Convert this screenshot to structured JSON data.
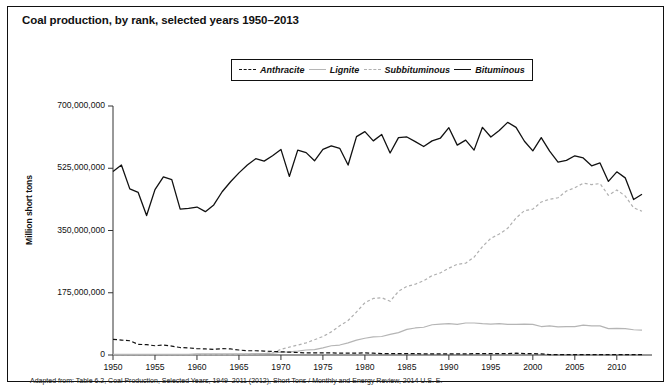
{
  "chart_title": "Coal production, by rank, selected years 1950–2013",
  "footnote": "Adapted from: Table 6.2, Coal Production, Selected Years, 1949–2011 (2012), Short Tons / Monthly and Energy Review, 2014 U.S. E.",
  "legend": {
    "position": "top-center",
    "items": [
      {
        "label": "Anthracite",
        "style": "dashed",
        "color": "#111111",
        "dash": "4,2.5"
      },
      {
        "label": "Lignite",
        "style": "solid",
        "color": "#b5b5b5",
        "dash": ""
      },
      {
        "label": "Subbituminous",
        "style": "dotted",
        "color": "#b0b0b0",
        "dash": "3,2.5"
      },
      {
        "label": "Bituminous",
        "style": "solid",
        "color": "#111111",
        "dash": ""
      }
    ]
  },
  "axes": {
    "ylabel": "Million short tons",
    "xlabel": "",
    "ylim": [
      0,
      700000000
    ],
    "xlim": [
      1950,
      2013
    ],
    "yticks": [
      0,
      175000000,
      350000000,
      525000000,
      700000000
    ],
    "ytick_labels": [
      "0",
      "175,000,000",
      "350,000,000",
      "525,000,000",
      "700,000,000"
    ],
    "xticks": [
      1950,
      1955,
      1960,
      1965,
      1970,
      1975,
      1980,
      1985,
      1990,
      1995,
      2000,
      2005,
      2010
    ],
    "xtick_labels": [
      "1950",
      "1955",
      "1960",
      "1965",
      "1970",
      "1975",
      "1980",
      "1985",
      "1990",
      "1995",
      "2000",
      "2005",
      "2010"
    ],
    "grid": false
  },
  "chart_data": {
    "type": "line",
    "title": "Coal production, by rank, selected years 1950–2013",
    "xlabel": "",
    "ylabel": "Million short tons",
    "ylim": [
      0,
      700000000
    ],
    "xlim": [
      1950,
      2013
    ],
    "grid": false,
    "legend_position": "top-center",
    "x": [
      1950,
      1951,
      1952,
      1953,
      1954,
      1955,
      1956,
      1957,
      1958,
      1959,
      1960,
      1961,
      1962,
      1963,
      1964,
      1965,
      1966,
      1967,
      1968,
      1969,
      1970,
      1971,
      1972,
      1973,
      1974,
      1975,
      1976,
      1977,
      1978,
      1979,
      1980,
      1981,
      1982,
      1983,
      1984,
      1985,
      1986,
      1987,
      1988,
      1989,
      1990,
      1991,
      1992,
      1993,
      1994,
      1995,
      1996,
      1997,
      1998,
      1999,
      2000,
      2001,
      2002,
      2003,
      2004,
      2005,
      2006,
      2007,
      2008,
      2009,
      2010,
      2011,
      2012,
      2013
    ],
    "series": [
      {
        "name": "Bituminous",
        "style": "solid",
        "color": "#111111",
        "values": [
          516000000,
          534000000,
          467000000,
          457000000,
          392000000,
          465000000,
          501000000,
          493000000,
          410000000,
          412000000,
          416000000,
          403000000,
          422000000,
          459000000,
          487000000,
          512000000,
          534000000,
          552000000,
          545000000,
          560000000,
          578000000,
          502000000,
          576000000,
          569000000,
          546000000,
          578000000,
          588000000,
          581000000,
          534000000,
          614000000,
          628000000,
          602000000,
          620000000,
          568000000,
          611000000,
          613000000,
          600000000,
          586000000,
          602000000,
          610000000,
          639000000,
          590000000,
          604000000,
          576000000,
          640000000,
          613000000,
          631000000,
          654000000,
          640000000,
          601000000,
          574000000,
          611000000,
          573000000,
          542000000,
          547000000,
          560000000,
          554000000,
          532000000,
          540000000,
          488000000,
          515000000,
          498000000,
          437000000,
          452000000
        ]
      },
      {
        "name": "Subbituminous",
        "style": "dotted",
        "color": "#b0b0b0",
        "values": [
          1000000,
          1000000,
          1000000,
          1000000,
          1000000,
          1000000,
          1000000,
          1000000,
          1000000,
          1000000,
          1000000,
          1000000,
          1000000,
          1000000,
          1000000,
          2000000,
          2000000,
          3000000,
          4000000,
          6000000,
          16000000,
          22000000,
          28000000,
          34000000,
          43000000,
          52000000,
          65000000,
          82000000,
          97000000,
          121000000,
          147000000,
          159000000,
          161000000,
          151000000,
          179000000,
          193000000,
          199000000,
          209000000,
          223000000,
          231000000,
          244000000,
          255000000,
          258000000,
          275000000,
          305000000,
          328000000,
          340000000,
          356000000,
          385000000,
          406000000,
          410000000,
          430000000,
          438000000,
          442000000,
          461000000,
          470000000,
          483000000,
          479000000,
          482000000,
          449000000,
          464000000,
          447000000,
          414000000,
          404000000
        ]
      },
      {
        "name": "Lignite",
        "style": "solid",
        "color": "#b5b5b5",
        "values": [
          2000000,
          2000000,
          2000000,
          2000000,
          2000000,
          2000000,
          2000000,
          2000000,
          2000000,
          2000000,
          3000000,
          3000000,
          3000000,
          3000000,
          3000000,
          3000000,
          3000000,
          4000000,
          4000000,
          5000000,
          8000000,
          9000000,
          11000000,
          14000000,
          15000000,
          20000000,
          26000000,
          28000000,
          34000000,
          42000000,
          47000000,
          51000000,
          52000000,
          58000000,
          63000000,
          72000000,
          76000000,
          78000000,
          85000000,
          87000000,
          88000000,
          86000000,
          90000000,
          90000000,
          88000000,
          87000000,
          88000000,
          86000000,
          86000000,
          87000000,
          86000000,
          80000000,
          82000000,
          79000000,
          80000000,
          80000000,
          84000000,
          82000000,
          82000000,
          74000000,
          75000000,
          74000000,
          71000000,
          70000000
        ]
      },
      {
        "name": "Anthracite",
        "style": "dashed",
        "color": "#111111",
        "values": [
          44000000,
          42000000,
          40000000,
          30000000,
          29000000,
          26000000,
          28000000,
          25000000,
          21000000,
          20000000,
          18000000,
          17000000,
          16000000,
          18000000,
          17000000,
          14000000,
          12000000,
          12000000,
          11000000,
          10000000,
          9000000,
          8000000,
          7000000,
          6000000,
          6000000,
          6000000,
          6000000,
          5000000,
          5000000,
          5000000,
          6000000,
          5000000,
          4000000,
          4000000,
          4000000,
          4000000,
          4000000,
          3000000,
          3000000,
          3000000,
          3000000,
          3000000,
          3000000,
          4000000,
          4000000,
          4000000,
          4000000,
          4000000,
          5000000,
          4000000,
          4000000,
          3000000,
          1000000,
          1000000,
          1000000,
          1000000,
          1000000,
          1000000,
          1000000,
          1000000,
          1000000,
          1000000,
          1000000,
          1000000
        ]
      }
    ]
  }
}
